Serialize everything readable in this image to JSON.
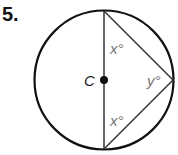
{
  "problem_number": "5.",
  "diagram": {
    "center_label": "C",
    "angles": [
      {
        "id": "top",
        "label": "x°"
      },
      {
        "id": "right",
        "label": "y°"
      },
      {
        "id": "bottom",
        "label": "x°"
      }
    ],
    "colors": {
      "stroke": "#111111",
      "angle_label": "#777777",
      "center_label": "#222222"
    }
  }
}
